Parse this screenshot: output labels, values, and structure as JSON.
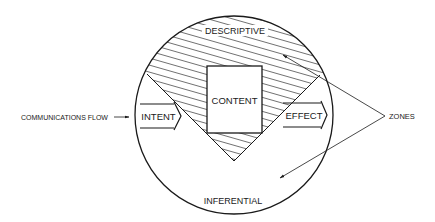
{
  "diagram": {
    "type": "communications-zones-diagram",
    "labels": {
      "descriptive": "DESCRIPTIVE",
      "inferential": "INFERENTIAL",
      "content": "CONTENT",
      "intent": "INTENT",
      "effect": "EFFECT",
      "communications_flow": "COMMUNICATIONS FLOW",
      "zones": "ZONES"
    },
    "colors": {
      "ink": "#1a1a1a",
      "background": "#ffffff"
    },
    "nodes": [
      {
        "id": "intent",
        "label": "INTENT",
        "shape": "arrow"
      },
      {
        "id": "content",
        "label": "CONTENT",
        "shape": "rectangle"
      },
      {
        "id": "effect",
        "label": "EFFECT",
        "shape": "arrow"
      },
      {
        "id": "descriptive",
        "label": "DESCRIPTIVE",
        "shape": "hatched-zone"
      },
      {
        "id": "inferential",
        "label": "INFERENTIAL",
        "shape": "unhatched-zone"
      }
    ],
    "edges": [
      {
        "from": "communications_flow",
        "to": "intent"
      },
      {
        "from": "intent",
        "to": "content"
      },
      {
        "from": "content",
        "to": "effect"
      },
      {
        "from": "zones",
        "to": "descriptive"
      },
      {
        "from": "zones",
        "to": "inferential"
      }
    ]
  }
}
